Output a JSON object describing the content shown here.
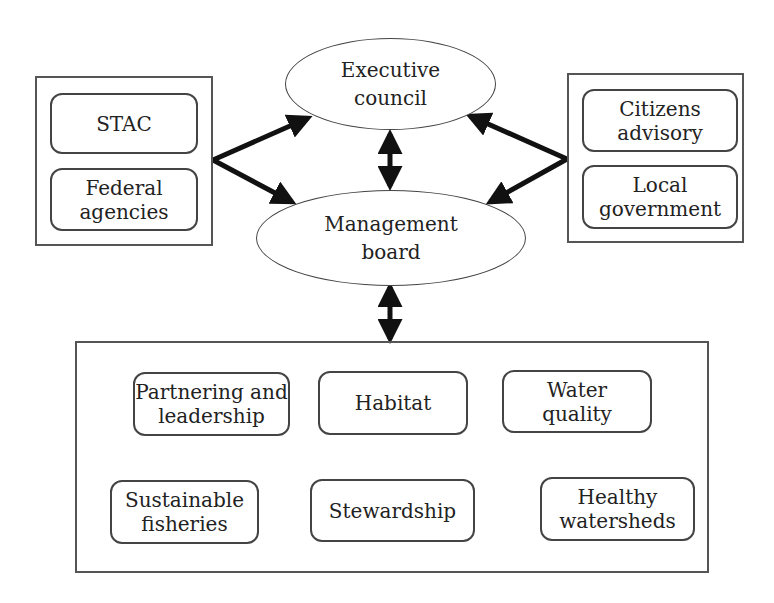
{
  "diagram": {
    "left_group": {
      "nodes": [
        {
          "label": "STAC"
        },
        {
          "label": "Federal\nagencies"
        }
      ]
    },
    "right_group": {
      "nodes": [
        {
          "label": "Citizens\nadvisory"
        },
        {
          "label": "Local\ngovernment"
        }
      ]
    },
    "executive_council": {
      "label": "Executive\ncouncil"
    },
    "management_board": {
      "label": "Management\nboard"
    },
    "goal_group": {
      "nodes": [
        {
          "label": "Partnering and\nleadership"
        },
        {
          "label": "Habitat"
        },
        {
          "label": "Water\nquality"
        },
        {
          "label": "Sustainable\nfisheries"
        },
        {
          "label": "Stewardship"
        },
        {
          "label": "Healthy\nwatersheds"
        }
      ]
    },
    "edges": [
      {
        "from": "left_group",
        "to": "executive_council"
      },
      {
        "from": "left_group",
        "to": "management_board"
      },
      {
        "from": "right_group",
        "to": "executive_council"
      },
      {
        "from": "right_group",
        "to": "management_board"
      },
      {
        "from": "executive_council",
        "to": "management_board",
        "bidirectional": true
      },
      {
        "from": "management_board",
        "to": "goal_group",
        "bidirectional": true
      }
    ]
  }
}
